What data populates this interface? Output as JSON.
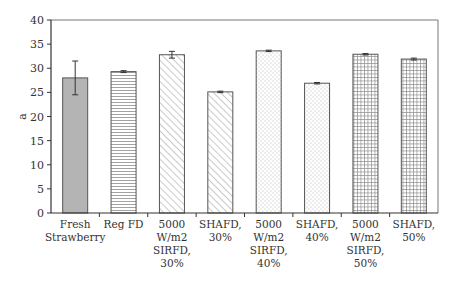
{
  "chart_data": {
    "type": "bar",
    "title": "",
    "xlabel": "",
    "ylabel": "a",
    "ylim": [
      0,
      40
    ],
    "yticks": [
      0,
      5,
      10,
      15,
      20,
      25,
      30,
      35,
      40
    ],
    "grid": false,
    "legend": null,
    "categories": [
      "Fresh Strawberry",
      "Reg FD",
      "5000 W/m2 SIRFD, 30%",
      "SHAFD, 30%",
      "5000 W/m2 SIRFD, 40%",
      "SHAFD, 40%",
      "5000 W/m2 SIRFD, 50%",
      "SHAFD, 50%"
    ],
    "category_lines": [
      [
        "Fresh",
        "Strawberry"
      ],
      [
        "Reg FD"
      ],
      [
        "5000",
        "W/m2",
        "SIRFD,",
        "30%"
      ],
      [
        "SHAFD,",
        "30%"
      ],
      [
        "5000",
        "W/m2",
        "SIRFD,",
        "40%"
      ],
      [
        "SHAFD,",
        "40%"
      ],
      [
        "5000",
        "W/m2",
        "SIRFD,",
        "50%"
      ],
      [
        "SHAFD,",
        "50%"
      ]
    ],
    "values": [
      28.0,
      29.3,
      32.8,
      25.1,
      33.6,
      26.9,
      32.9,
      31.9
    ],
    "errors": [
      3.5,
      0.2,
      0.7,
      0.15,
      0.15,
      0.15,
      0.15,
      0.2
    ],
    "patterns": [
      "solid-gray",
      "horizontal-lines",
      "diagonal-lines",
      "diagonal-lines",
      "dots",
      "dots",
      "grid",
      "grid"
    ]
  },
  "colors": {
    "axis": "#333333",
    "bar_outline": "#555555",
    "solid_fill": "#b4b4b4",
    "pattern_stroke": "#8a8a8a"
  }
}
